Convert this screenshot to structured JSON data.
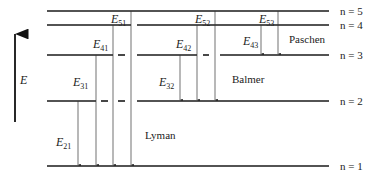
{
  "axis": {
    "label": "E"
  },
  "levels": [
    {
      "n": 5,
      "label": "n = 5"
    },
    {
      "n": 4,
      "label": "n = 4"
    },
    {
      "n": 3,
      "label": "n = 3"
    },
    {
      "n": 2,
      "label": "n = 2"
    },
    {
      "n": 1,
      "label": "n = 1"
    }
  ],
  "series": [
    {
      "name": "Lyman",
      "final": 1,
      "transitions": [
        {
          "from": 2,
          "to": 1,
          "label": "E",
          "sub": "21"
        },
        {
          "from": 3,
          "to": 1,
          "label": "E",
          "sub": "31"
        },
        {
          "from": 4,
          "to": 1,
          "label": "E",
          "sub": "41"
        },
        {
          "from": 5,
          "to": 1,
          "label": "E",
          "sub": "51"
        }
      ]
    },
    {
      "name": "Balmer",
      "final": 2,
      "transitions": [
        {
          "from": 3,
          "to": 2,
          "label": "E",
          "sub": "32"
        },
        {
          "from": 4,
          "to": 2,
          "label": "E",
          "sub": "42"
        },
        {
          "from": 5,
          "to": 2,
          "label": "E",
          "sub": "52"
        }
      ]
    },
    {
      "name": "Paschen",
      "final": 3,
      "transitions": [
        {
          "from": 4,
          "to": 3,
          "label": "E",
          "sub": "43"
        },
        {
          "from": 5,
          "to": 3,
          "label": "E",
          "sub": "53"
        }
      ]
    }
  ]
}
